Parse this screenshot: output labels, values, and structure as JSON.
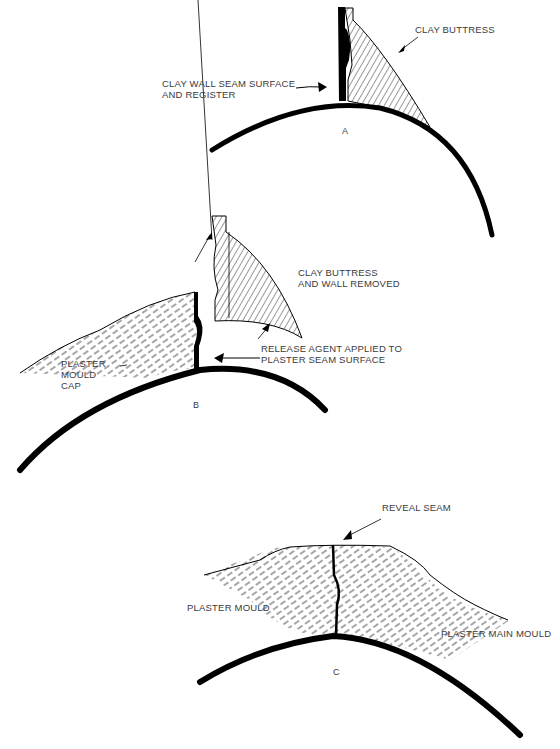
{
  "diagram": {
    "panels": [
      {
        "id": "A",
        "letter": "A",
        "labels": {
          "clay_buttress": "CLAY BUTTRESS",
          "seam_line1": "CLAY WALL SEAM SURFACE",
          "seam_line2": "AND REGISTER"
        }
      },
      {
        "id": "B",
        "letter": "B",
        "labels": {
          "removed_line1": "CLAY BUTTRESS",
          "removed_line2": "AND WALL REMOVED",
          "release_line1": "RELEASE AGENT APPLIED TO",
          "release_line2": "PLASTER SEAM SURFACE",
          "cap_line1": "PLASTER",
          "cap_line2": "MOULD",
          "cap_line3": "CAP"
        }
      },
      {
        "id": "C",
        "letter": "C",
        "labels": {
          "reveal_seam": "REVEAL SEAM",
          "plaster_mould": "PLASTER MOULD",
          "plaster_main_mould": "PLASTER MAIN MOULD"
        }
      }
    ],
    "colors": {
      "ink": "#000000",
      "text": "#3a3a3a",
      "background": "#ffffff"
    }
  }
}
